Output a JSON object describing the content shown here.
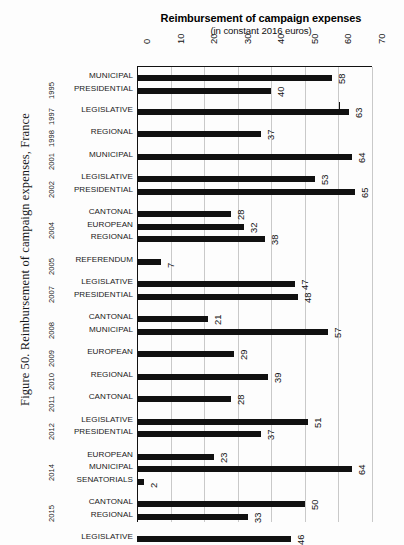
{
  "figure": {
    "caption": "Figure 50. Reimbursement of campaign expenses, France"
  },
  "chart_data": {
    "type": "bar",
    "orientation": "horizontal",
    "title": "Reimbursement of campaign expenses",
    "subtitle": "(in constant 2016 euros)",
    "xlabel": "",
    "ylabel": "",
    "xlim": [
      0,
      70
    ],
    "xticks": [
      0,
      10,
      20,
      30,
      40,
      50,
      60,
      70
    ],
    "xtick_labels": [
      "0",
      "10",
      "20",
      "30",
      "40",
      "50",
      "60",
      "70"
    ],
    "grid": true,
    "grid_axis": "x",
    "legend": false,
    "bar_color": "#111111",
    "categories": [
      "MUNICIPAL",
      "PRESIDENTIAL",
      "LEGISLATIVE",
      "REGIONAL",
      "MUNICIPAL",
      "LEGISLATIVE",
      "PRESIDENTIAL",
      "CANTONAL",
      "EUROPEAN",
      "REGIONAL",
      "REFERENDUM",
      "LEGISLATIVE",
      "PRESIDENTIAL",
      "CANTONAL",
      "MUNICIPAL",
      "EUROPEAN",
      "REGIONAL",
      "CANTONAL",
      "LEGISLATIVE",
      "PRESIDENTIAL",
      "EUROPEAN",
      "MUNICIPAL",
      "SENATORIALS",
      "CANTONAL",
      "REGIONAL",
      "LEGISLATIVE",
      "PRESIDENTIAL",
      "SENATORIALS"
    ],
    "values": [
      58,
      40,
      63,
      37,
      64,
      53,
      65,
      28,
      32,
      38,
      7,
      47,
      48,
      21,
      57,
      29,
      39,
      28,
      51,
      37,
      23,
      64,
      2,
      50,
      33,
      46,
      41,
      2
    ],
    "years": [
      "1995",
      "1997",
      "1998",
      "2001",
      "2002",
      "2004",
      "2005",
      "2007",
      "2008",
      "2009",
      "2010",
      "2011",
      "2012",
      "2014",
      "2015",
      "2017"
    ]
  },
  "rows": [
    {
      "category": "MUNICIPAL",
      "value": "58",
      "top": 8,
      "group": 0
    },
    {
      "category": "PRESIDENTIAL",
      "value": "40",
      "top": 21,
      "group": 0
    },
    {
      "category": "LEGISLATIVE",
      "value": "63",
      "top": 42,
      "group": 1
    },
    {
      "category": "REGIONAL",
      "value": "37",
      "top": 64,
      "group": 2
    },
    {
      "category": "MUNICIPAL",
      "value": "64",
      "top": 87,
      "group": 3
    },
    {
      "category": "LEGISLATIVE",
      "value": "53",
      "top": 109,
      "group": 4
    },
    {
      "category": "PRESIDENTIAL",
      "value": "65",
      "top": 122,
      "group": 4
    },
    {
      "category": "CANTONAL",
      "value": "28",
      "top": 144,
      "group": 5
    },
    {
      "category": "EUROPEAN",
      "value": "32",
      "top": 157,
      "group": 5
    },
    {
      "category": "REGIONAL",
      "value": "38",
      "top": 169,
      "group": 5
    },
    {
      "category": "REFERENDUM",
      "value": "7",
      "top": 192,
      "group": 6
    },
    {
      "category": "LEGISLATIVE",
      "value": "47",
      "top": 214,
      "group": 7
    },
    {
      "category": "PRESIDENTIAL",
      "value": "48",
      "top": 227,
      "group": 7
    },
    {
      "category": "CANTONAL",
      "value": "21",
      "top": 249,
      "group": 8
    },
    {
      "category": "MUNICIPAL",
      "value": "57",
      "top": 262,
      "group": 8
    },
    {
      "category": "EUROPEAN",
      "value": "29",
      "top": 284,
      "group": 9
    },
    {
      "category": "REGIONAL",
      "value": "39",
      "top": 307,
      "group": 10
    },
    {
      "category": "CANTONAL",
      "value": "28",
      "top": 329,
      "group": 11
    },
    {
      "category": "LEGISLATIVE",
      "value": "51",
      "top": 352,
      "group": 12
    },
    {
      "category": "PRESIDENTIAL",
      "value": "37",
      "top": 364,
      "group": 12
    },
    {
      "category": "EUROPEAN",
      "value": "23",
      "top": 387,
      "group": 13
    },
    {
      "category": "MUNICIPAL",
      "value": "64",
      "top": 399,
      "group": 13
    },
    {
      "category": "SENATORIALS",
      "value": "2",
      "top": 412,
      "group": 13
    },
    {
      "category": "CANTONAL",
      "value": "50",
      "top": 434,
      "group": 14
    },
    {
      "category": "REGIONAL",
      "value": "33",
      "top": 447,
      "group": 14
    },
    {
      "category": "LEGISLATIVE",
      "value": "46",
      "top": 469,
      "group": 15
    },
    {
      "category": "PRESIDENTIAL",
      "value": "41",
      "top": 482,
      "group": 15
    },
    {
      "category": "SENATORIALS",
      "value": "2",
      "top": 494,
      "group": 15
    }
  ],
  "year_marks": [
    {
      "label": "1995",
      "top": 10
    },
    {
      "label": "1997",
      "top": 36
    },
    {
      "label": "1998",
      "top": 58
    },
    {
      "label": "2001",
      "top": 81
    },
    {
      "label": "2002",
      "top": 109
    },
    {
      "label": "2004",
      "top": 150
    },
    {
      "label": "2005",
      "top": 186
    },
    {
      "label": "2007",
      "top": 214
    },
    {
      "label": "2008",
      "top": 250
    },
    {
      "label": "2009",
      "top": 278
    },
    {
      "label": "2010",
      "top": 301
    },
    {
      "label": "2011",
      "top": 323
    },
    {
      "label": "2012",
      "top": 351
    },
    {
      "label": "2014",
      "top": 392
    },
    {
      "label": "2015",
      "top": 433
    },
    {
      "label": "2017",
      "top": 474
    }
  ],
  "axis": {
    "ticks": [
      "0",
      "10",
      "20",
      "30",
      "40",
      "50",
      "60",
      "70"
    ]
  }
}
